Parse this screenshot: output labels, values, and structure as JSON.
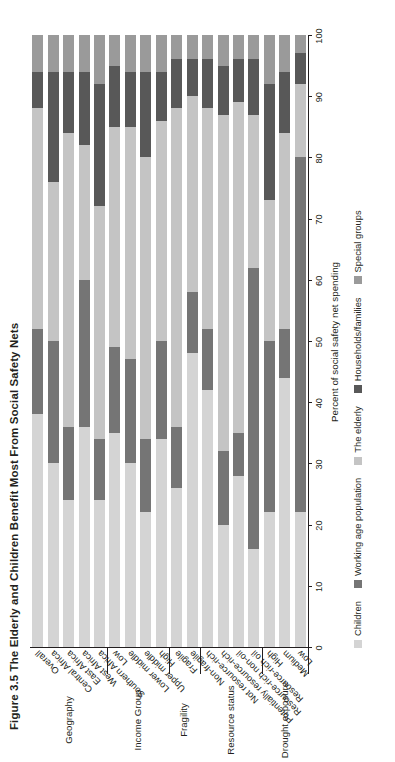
{
  "figure": {
    "number": "Figure 3.5",
    "title": "The Elderly and Children Benefit Most From Social Safety Nets"
  },
  "axis": {
    "value_title": "Percent of social safety net spending",
    "ticks": [
      0,
      10,
      20,
      30,
      40,
      50,
      60,
      70,
      80,
      90,
      100
    ]
  },
  "legend": {
    "items": [
      {
        "label": "Children",
        "color": "#d4d4d4"
      },
      {
        "label": "Working age population",
        "color": "#757575"
      },
      {
        "label": "The elderly",
        "color": "#c4c4c4"
      },
      {
        "label": "Households/families",
        "color": "#585858"
      },
      {
        "label": "Special groups",
        "color": "#9a9a9a"
      }
    ]
  },
  "groups": [
    {
      "name": "Geography",
      "count": 5
    },
    {
      "name": "Income Group",
      "count": 4
    },
    {
      "name": "Fragility",
      "count": 2
    },
    {
      "name": "Resource status",
      "count": 4
    },
    {
      "name": "Drought exposure",
      "count": 3
    }
  ],
  "chart_data": {
    "type": "bar",
    "orientation": "vertical-stacked-100",
    "title": "The Elderly and Children Benefit Most From Social Safety Nets",
    "xlabel": "",
    "ylabel": "Percent of social safety net spending",
    "ylim": [
      0,
      100
    ],
    "grid": false,
    "legend_position": "bottom",
    "series": [
      {
        "name": "Children",
        "color": "#d4d4d4",
        "values": [
          38,
          30,
          24,
          36,
          24,
          35,
          30,
          22,
          34,
          26,
          48,
          42,
          20,
          28,
          16,
          22,
          44,
          22
        ]
      },
      {
        "name": "Working age population",
        "color": "#757575",
        "values": [
          14,
          20,
          12,
          24,
          10,
          14,
          17,
          12,
          16,
          10,
          10,
          10,
          12,
          7,
          46,
          28,
          8,
          58
        ]
      },
      {
        "name": "The elderly",
        "color": "#c4c4c4",
        "values": [
          36,
          26,
          48,
          22,
          38,
          36,
          38,
          46,
          36,
          52,
          32,
          36,
          55,
          54,
          25,
          23,
          32,
          12
        ]
      },
      {
        "name": "Households/families",
        "color": "#585858",
        "values": [
          6,
          18,
          10,
          12,
          20,
          10,
          9,
          14,
          8,
          8,
          6,
          8,
          8,
          7,
          9,
          19,
          10,
          5
        ]
      },
      {
        "name": "Special groups",
        "color": "#9a9a9a",
        "values": [
          6,
          6,
          6,
          6,
          8,
          5,
          6,
          6,
          6,
          4,
          4,
          4,
          5,
          4,
          4,
          8,
          6,
          3
        ]
      }
    ],
    "categories": [
      "Overall",
      "Central Africa",
      "East Africa",
      "West Africa",
      "Southern Africa",
      "Low",
      "Lower middle",
      "Upper middle",
      "High",
      "Fragile",
      "Non-fragile",
      "Not resource-rich",
      "Potentially resource-rich",
      "Resource-rich non-oil",
      "Resource-rich oil",
      "High",
      "Medium",
      "Low"
    ]
  }
}
